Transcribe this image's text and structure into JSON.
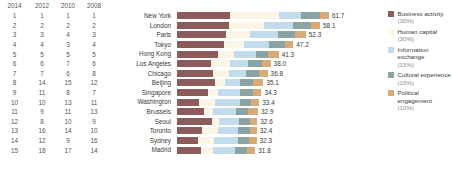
{
  "table": {
    "headers": [
      "2014",
      "2012",
      "2010",
      "2008"
    ],
    "rows": [
      [
        "1",
        "1",
        "1",
        "1"
      ],
      [
        "2",
        "2",
        "2",
        "2"
      ],
      [
        "3",
        "3",
        "4",
        "3"
      ],
      [
        "4",
        "4",
        "3",
        "4"
      ],
      [
        "5",
        "5",
        "5",
        "5"
      ],
      [
        "6",
        "6",
        "7",
        "6"
      ],
      [
        "7",
        "7",
        "6",
        "8"
      ],
      [
        "8",
        "14",
        "15",
        "12"
      ],
      [
        "9",
        "11",
        "8",
        "7"
      ],
      [
        "10",
        "10",
        "13",
        "11"
      ],
      [
        "11",
        "9",
        "11",
        "13"
      ],
      [
        "12",
        "8",
        "10",
        "9"
      ],
      [
        "13",
        "16",
        "14",
        "10"
      ],
      [
        "14",
        "12",
        "9",
        "16"
      ],
      [
        "15",
        "18",
        "17",
        "14"
      ]
    ]
  },
  "chart_data": {
    "type": "bar",
    "orientation": "horizontal",
    "stacked": true,
    "title": "",
    "xlabel": "",
    "ylabel": "",
    "xlim": [
      0,
      61.7
    ],
    "grid": false,
    "legend_position": "right",
    "categories": [
      "New York",
      "London",
      "Paris",
      "Tokyo",
      "Hong Kong",
      "Los Angeles",
      "Chicago",
      "Beijing",
      "Singapore",
      "Washington",
      "Brussels",
      "Seoul",
      "Toronto",
      "Sydney",
      "Madrid"
    ],
    "totals": [
      61.7,
      58.1,
      52.3,
      47.2,
      41.3,
      38.0,
      36.8,
      35.1,
      34.3,
      33.4,
      32.9,
      32.6,
      32.4,
      32.3,
      31.8
    ],
    "total_labels": [
      "61.7",
      "58.1",
      "52.3",
      "47.2",
      "41.3",
      "38.0",
      "36.8",
      "35.1",
      "34.3",
      "33.4",
      "32.9",
      "32.6",
      "32.4",
      "32.3",
      "31.8"
    ],
    "series": [
      {
        "name": "Business activity",
        "weight": "(30%)",
        "color": "#8d5b5b",
        "values": [
          21.5,
          21.0,
          20.0,
          19.2,
          16.5,
          13.8,
          14.8,
          15.5,
          12.6,
          8.9,
          11.0,
          14.4,
          10.2,
          8.6,
          9.6
        ]
      },
      {
        "name": "Human capital",
        "weight": "(30%)",
        "color": "#faf5e4",
        "values": [
          19.8,
          14.2,
          9.5,
          8.0,
          6.8,
          7.9,
          6.2,
          4.0,
          4.1,
          6.6,
          3.6,
          2.8,
          6.3,
          6.4,
          5.2
        ]
      },
      {
        "name": "Information exchange",
        "weight": "(15%)",
        "color": "#c3dced",
        "values": [
          9.2,
          12.0,
          11.5,
          10.3,
          8.6,
          7.3,
          7.2,
          6.2,
          8.9,
          10.2,
          9.3,
          7.8,
          8.4,
          9.6,
          8.6
        ]
      },
      {
        "name": "Cultural experience",
        "weight": "(15%)",
        "color": "#8ba3a3",
        "values": [
          7.6,
          7.4,
          7.1,
          6.3,
          5.2,
          5.6,
          5.1,
          5.2,
          5.2,
          4.4,
          5.0,
          4.8,
          4.6,
          4.6,
          5.2
        ]
      },
      {
        "name": "Political engagement",
        "weight": "(10%)",
        "color": "#d9a978",
        "values": [
          3.6,
          3.5,
          4.2,
          3.4,
          4.2,
          3.4,
          3.5,
          4.2,
          3.5,
          3.3,
          4.0,
          2.8,
          2.9,
          3.1,
          3.2
        ]
      }
    ]
  },
  "legend": {
    "items": [
      {
        "label": "Business activity",
        "pct": "(30%)",
        "color": "#8d5b5b",
        "icon": "legend-swatch-business-activity"
      },
      {
        "label": "Human capital",
        "pct": "(30%)",
        "color": "#faf5e4",
        "icon": "legend-swatch-human-capital"
      },
      {
        "label": "Information exchange",
        "pct": "(15%)",
        "color": "#c3dced",
        "icon": "legend-swatch-information-exchange"
      },
      {
        "label": "Cultural experience",
        "pct": "(15%)",
        "color": "#8ba3a3",
        "icon": "legend-swatch-cultural-experience"
      },
      {
        "label": "Political engagement",
        "pct": "(10%)",
        "color": "#d9a978",
        "icon": "legend-swatch-political-engagement"
      }
    ]
  }
}
